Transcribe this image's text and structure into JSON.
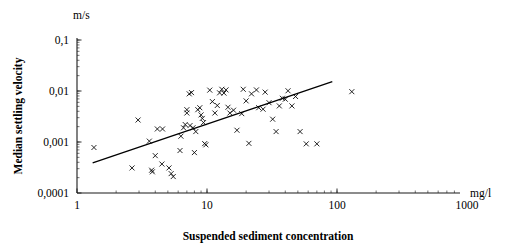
{
  "chart_data": {
    "type": "scatter",
    "title": "",
    "xlabel": "Suspended sediment concentration",
    "ylabel": "Median settling velocity",
    "x_unit": "mg/l",
    "y_unit": "m/s",
    "xscale": "log",
    "yscale": "log",
    "xlim": [
      1,
      1000
    ],
    "ylim": [
      0.0001,
      0.1
    ],
    "grid": false,
    "legend": null,
    "x_tick_labels": [
      "1",
      "10",
      "100",
      "1000"
    ],
    "x_tick_values": [
      1,
      10,
      100,
      1000
    ],
    "y_tick_labels": [
      "0,1",
      "0,01",
      "0,001",
      "0,0001"
    ],
    "y_tick_values": [
      0.1,
      0.01,
      0.001,
      0.0001
    ],
    "marker": "x",
    "marker_color": "#000000",
    "points": [
      [
        1.35,
        0.00078
      ],
      [
        2.65,
        0.00031
      ],
      [
        2.95,
        0.0027
      ],
      [
        3.6,
        0.00104
      ],
      [
        3.75,
        0.00028
      ],
      [
        3.8,
        0.00026
      ],
      [
        4.0,
        0.00054
      ],
      [
        4.15,
        0.0018
      ],
      [
        4.55,
        0.0018
      ],
      [
        4.5,
        0.00037
      ],
      [
        5.1,
        0.00031
      ],
      [
        5.3,
        0.00024
      ],
      [
        5.5,
        0.00021
      ],
      [
        6.2,
        0.00068
      ],
      [
        6.3,
        0.0013
      ],
      [
        6.6,
        0.0019
      ],
      [
        6.8,
        0.0022
      ],
      [
        7.0,
        0.0043
      ],
      [
        7.0,
        0.0037
      ],
      [
        7.3,
        0.0088
      ],
      [
        7.6,
        0.0093
      ],
      [
        7.4,
        0.0021
      ],
      [
        7.8,
        0.0019
      ],
      [
        8.0,
        0.00062
      ],
      [
        8.2,
        0.0016
      ],
      [
        8.5,
        0.0043
      ],
      [
        8.8,
        0.0047
      ],
      [
        9.0,
        0.0034
      ],
      [
        9.2,
        0.0029
      ],
      [
        9.4,
        0.0024
      ],
      [
        9.6,
        0.00093
      ],
      [
        9.8,
        0.00088
      ],
      [
        10.5,
        0.0104
      ],
      [
        11.0,
        0.0062
      ],
      [
        11.5,
        0.0037
      ],
      [
        12.0,
        0.0052
      ],
      [
        12.5,
        0.0092
      ],
      [
        13.0,
        0.0108
      ],
      [
        13.5,
        0.0091
      ],
      [
        14.0,
        0.0105
      ],
      [
        14.5,
        0.0048
      ],
      [
        15.0,
        0.0037
      ],
      [
        16.0,
        0.0042
      ],
      [
        17.0,
        0.0017
      ],
      [
        18.5,
        0.0036
      ],
      [
        19.0,
        0.0108
      ],
      [
        20.0,
        0.0064
      ],
      [
        21.0,
        0.00094
      ],
      [
        22.0,
        0.0088
      ],
      [
        24.0,
        0.0105
      ],
      [
        25.0,
        0.0047
      ],
      [
        27.0,
        0.0044
      ],
      [
        28.0,
        0.0095
      ],
      [
        30.0,
        0.0059
      ],
      [
        32.0,
        0.0028
      ],
      [
        34.0,
        0.0016
      ],
      [
        36.0,
        0.0051
      ],
      [
        38.0,
        0.0072
      ],
      [
        40.0,
        0.0069
      ],
      [
        42.0,
        0.0101
      ],
      [
        45.0,
        0.0051
      ],
      [
        48.0,
        0.0078
      ],
      [
        52.0,
        0.0016
      ],
      [
        58.0,
        0.00092
      ],
      [
        70.0,
        0.00092
      ],
      [
        130.0,
        0.0097
      ]
    ],
    "trend_line": {
      "label": "regression line",
      "x_start": 1.32,
      "y_start": 0.00039,
      "x_end": 92.0,
      "y_end": 0.0152
    }
  }
}
